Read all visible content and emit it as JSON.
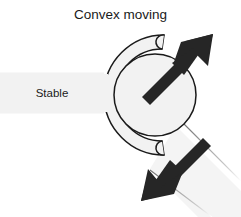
{
  "figure": {
    "type": "joint-mobilization-diagram",
    "title_label": "Convex moving",
    "stable_label": "Stable",
    "colors": {
      "background": "#ffffff",
      "body_fill": "#f2f2f2",
      "outline": "#1a1a1a",
      "arrow": "#262626",
      "text": "#1a1a1a",
      "band_fill": "#f4f4f4"
    },
    "parts": [
      {
        "name": "stable-bar",
        "label": "Stable",
        "description": "horizontal stationary segment on the left"
      },
      {
        "name": "concave-cup",
        "label": "",
        "description": "C-shaped socket opening to the right"
      },
      {
        "name": "convex-head",
        "label": "Convex moving",
        "description": "circular moving bone end seated in the cup"
      },
      {
        "name": "motion-band",
        "label": "",
        "description": "light shaft extending down-right from the head"
      }
    ],
    "arrows": [
      {
        "name": "arrow-up-right",
        "direction": "up-right",
        "angle_deg": 45,
        "tip": [
          213,
          34
        ],
        "tail": [
          146,
          101
        ]
      },
      {
        "name": "arrow-down-left",
        "direction": "down-left",
        "angle_deg": 225,
        "tip": [
          141,
          201
        ],
        "tail": [
          201,
          141
        ]
      }
    ]
  }
}
